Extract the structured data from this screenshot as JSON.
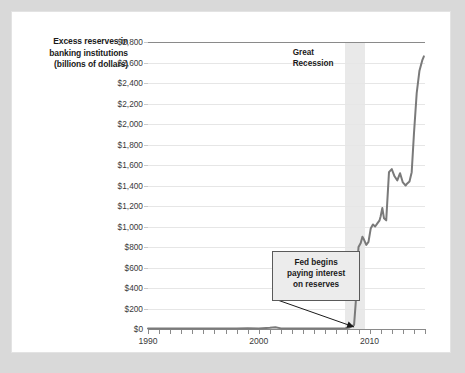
{
  "chart_data": {
    "type": "line",
    "title": "",
    "xlabel": "",
    "ylabel": "Excess reserves in banking institutions (billions of dollars)",
    "xlim": [
      1990,
      2015
    ],
    "ylim": [
      0,
      2800
    ],
    "grid": true,
    "legend": "none",
    "y_ticks": [
      "$0",
      "$200",
      "$400",
      "$600",
      "$800",
      "$1,000",
      "$1,200",
      "$1,400",
      "$1,600",
      "$1,800",
      "$2,000",
      "$2,200",
      "$2,400",
      "$2,600",
      "$2,800"
    ],
    "y_tick_values": [
      0,
      200,
      400,
      600,
      800,
      1000,
      1200,
      1400,
      1600,
      1800,
      2000,
      2200,
      2400,
      2600,
      2800
    ],
    "x_ticks": [
      "1990",
      "2000",
      "2010"
    ],
    "x_tick_values": [
      1990,
      2000,
      2010
    ],
    "x_minor_tick_step": 1,
    "series": [
      {
        "name": "Excess reserves",
        "color": "#7a7a7a",
        "x": [
          1990.0,
          1991.0,
          1992.0,
          1993.0,
          1994.0,
          1995.0,
          1996.0,
          1997.0,
          1998.0,
          1999.0,
          2000.0,
          2001.0,
          2001.5,
          2002.0,
          2003.0,
          2004.0,
          2005.0,
          2006.0,
          2007.0,
          2007.8,
          2008.2,
          2008.6,
          2008.75,
          2008.85,
          2009.0,
          2009.2,
          2009.35,
          2009.5,
          2009.7,
          2009.9,
          2010.1,
          2010.3,
          2010.5,
          2010.7,
          2010.9,
          2011.0,
          2011.15,
          2011.3,
          2011.5,
          2011.75,
          2012.0,
          2012.25,
          2012.5,
          2012.75,
          2013.0,
          2013.25,
          2013.4,
          2013.6,
          2013.8,
          2014.0,
          2014.25,
          2014.5,
          2014.75,
          2014.9
        ],
        "y": [
          5,
          5,
          6,
          6,
          5,
          5,
          5,
          4,
          5,
          8,
          5,
          12,
          18,
          6,
          5,
          5,
          5,
          5,
          5,
          8,
          15,
          40,
          260,
          560,
          800,
          840,
          900,
          870,
          820,
          850,
          980,
          1020,
          1000,
          1030,
          1060,
          1100,
          1180,
          1080,
          1060,
          1530,
          1560,
          1490,
          1450,
          1520,
          1430,
          1400,
          1420,
          1440,
          1530,
          1900,
          2300,
          2520,
          2620,
          2660
        ]
      }
    ],
    "annotations": [
      {
        "name": "recession-band",
        "type": "vspan",
        "label": "Great\nRecession",
        "x_start": 2007.75,
        "x_end": 2009.6,
        "color": "#e7e7e7"
      },
      {
        "name": "fed-callout",
        "type": "callout",
        "label": "Fed begins\npaying interest\non reserves",
        "point_x": 2008.6,
        "point_y": 20
      }
    ]
  },
  "figure": {
    "y_axis_title": "Excess reserves\nin banking\ninstitutions\n(billions of\ndollars)",
    "recession_label": "Great\nRecession",
    "fed_callout_label": "Fed begins\npaying interest\non reserves",
    "line_color": "#7a7a7a",
    "band_color": "#e7e7e7",
    "grid_color": "#e6e6e6",
    "axis_color": "#8a8a8a",
    "background": "#ffffff",
    "page_background": "#d9d9d9"
  }
}
